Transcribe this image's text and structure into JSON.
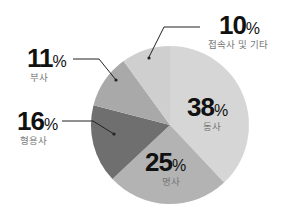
{
  "chart_data": {
    "type": "pie",
    "title": "",
    "start_angle_deg": 0,
    "direction": "clockwise",
    "slices": [
      {
        "label": "동사",
        "value": 38,
        "display": "38",
        "color": "#d6d6d6"
      },
      {
        "label": "명사",
        "value": 25,
        "display": "25",
        "color": "#b3b3b3"
      },
      {
        "label": "형용사",
        "value": 16,
        "display": "16",
        "color": "#6f6f6f"
      },
      {
        "label": "부사",
        "value": 11,
        "display": "11",
        "color": "#a9a9a9"
      },
      {
        "label": "접속사 및 기타",
        "value": 10,
        "display": "10",
        "color": "#cfcfcf"
      }
    ],
    "unit": "%",
    "legend": "none (direct labels)"
  },
  "labels": {
    "verb": {
      "num": "38",
      "sym": "%",
      "cat": "동사"
    },
    "noun": {
      "num": "25",
      "sym": "%",
      "cat": "명사"
    },
    "adjective": {
      "num": "16",
      "sym": "%",
      "cat": "형용사"
    },
    "adverb": {
      "num": "11",
      "sym": "%",
      "cat": "부사"
    },
    "other": {
      "num": "10",
      "sym": "%",
      "cat": "접속사 및 기타"
    }
  }
}
